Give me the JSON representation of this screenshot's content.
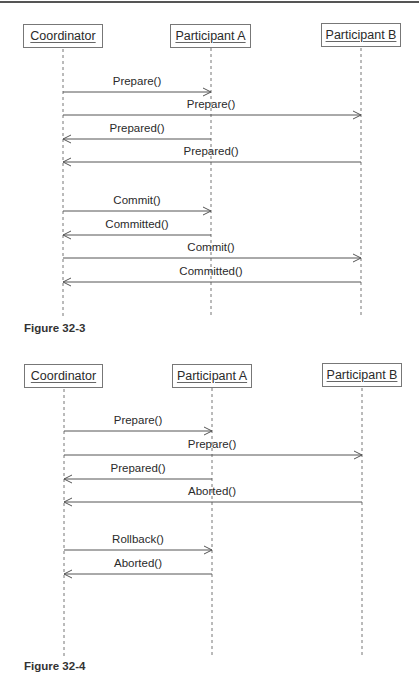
{
  "figures": [
    {
      "caption": "Figure 32-3",
      "participants": [
        {
          "label": "Coordinator"
        },
        {
          "label": "Participant A"
        },
        {
          "label": "Participant B"
        }
      ],
      "messages": [
        {
          "label": "Prepare()",
          "from": "Coordinator",
          "to": "Participant A"
        },
        {
          "label": "Prepare()",
          "from": "Coordinator",
          "to": "Participant B"
        },
        {
          "label": "Prepared()",
          "from": "Participant A",
          "to": "Coordinator"
        },
        {
          "label": "Prepared()",
          "from": "Participant B",
          "to": "Coordinator"
        },
        {
          "label": "Commit()",
          "from": "Coordinator",
          "to": "Participant A"
        },
        {
          "label": "Committed()",
          "from": "Participant A",
          "to": "Coordinator"
        },
        {
          "label": "Commit()",
          "from": "Coordinator",
          "to": "Participant B"
        },
        {
          "label": "Committed()",
          "from": "Participant B",
          "to": "Coordinator"
        }
      ]
    },
    {
      "caption": "Figure 32-4",
      "participants": [
        {
          "label": "Coordinator"
        },
        {
          "label": "Participant A"
        },
        {
          "label": "Participant B"
        }
      ],
      "messages": [
        {
          "label": "Prepare()",
          "from": "Coordinator",
          "to": "Participant A"
        },
        {
          "label": "Prepare()",
          "from": "Coordinator",
          "to": "Participant B"
        },
        {
          "label": "Prepared()",
          "from": "Participant A",
          "to": "Coordinator"
        },
        {
          "label": "Aborted()",
          "from": "Participant B",
          "to": "Coordinator"
        },
        {
          "label": "Rollback()",
          "from": "Coordinator",
          "to": "Participant A"
        },
        {
          "label": "Aborted()",
          "from": "Participant A",
          "to": "Coordinator"
        }
      ]
    }
  ],
  "colors": {
    "line": "#666666",
    "text": "#2a2a2a"
  }
}
